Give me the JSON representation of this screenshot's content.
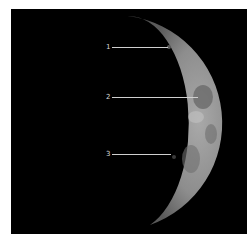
{
  "image": {
    "subject": "waxing crescent moon with labeled features",
    "background_color": "#000000",
    "frame_color": "#ffffff"
  },
  "labels": [
    {
      "text": "1",
      "x": 95,
      "y": 34,
      "line_to_x": 157
    },
    {
      "text": "2",
      "x": 95,
      "y": 84,
      "line_to_x": 187
    },
    {
      "text": "3",
      "x": 95,
      "y": 141,
      "line_to_x": 160
    }
  ]
}
